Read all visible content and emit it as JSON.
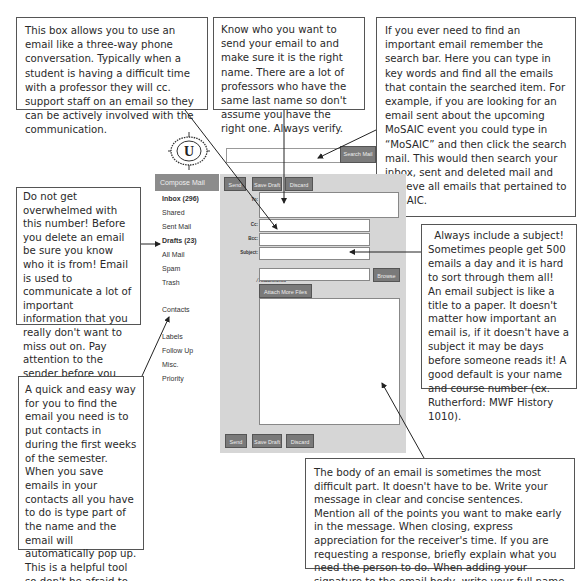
{
  "callouts": {
    "cc": "This box allows you to use an email like a three-way phone conversation. Typically when a student is having a difficult time with a professor they will cc. support staff on an email so they can be actively involved with the communication.",
    "to": "Know who you want to send your email to and make sure it is the right name. There are a lot of professors who have the same last name so don't assume you have the right one. Always verify.",
    "search": "If you ever need to find an important email remember the search bar. Here you can type in key words and find all the emails that contain the searched item. For example, if you are looking for an email sent about the upcoming MoSAIC event you could type in “MoSAIC” and then click the search mail. This would then search your inbox, sent and deleted mail and retrieve all emails that pertained to MoSAIC.",
    "inbox": "Do not get overwhelmed with this number! Before you delete an email be sure you know who it is from! Email is used to communicate a lot of important information that you really don't want to miss out on. Pay attention to the sender before you just get overwhelmed. IF it's not important to you then delete it.",
    "contacts": "A quick and easy way for you to find the email you need is to put contacts in during the first weeks of the semester. When you save emails in your contacts all you have to do is type part of the name and the email will automatically pop up. This is a helpful tool so don't be afraid to use it!",
    "subject_title": "Always include a subject!",
    "subject": "Sometimes people get 500 emails a day and it is hard to sort through them all! An email subject is like a title to a paper. It doesn't matter how important an email is, if it doesn't have a subject it may be days before someone reads it! A good default is your name and course number (ex. Rutherford: MWF History 1010).",
    "body": "The body of an email is sometimes the most difficult part. It doesn't have to be. Write your message in clear and concise sentences. Mention all of the points you want to make early in the message. When closing, express appreciation for the receiver's time. If you are requesting a response, briefly explain what you need the person to do. When adding your signature to the email body, write your full name and, if applicable, your university ID number."
  },
  "logo": {
    "letter": "U"
  },
  "search": {
    "placeholder": "",
    "button": "Search Mail"
  },
  "sidebar": {
    "compose": "Compose Mail",
    "items": [
      {
        "label": "Inbox (296)",
        "bold": true
      },
      {
        "label": "Shared"
      },
      {
        "label": "Sent Mail"
      },
      {
        "label": "Drafts (23)",
        "bold": true
      },
      {
        "label": "All Mail"
      },
      {
        "label": "Spam"
      },
      {
        "label": "Trash"
      },
      {
        "label": "Contacts"
      },
      {
        "label": "Labels"
      },
      {
        "label": "Follow Up"
      },
      {
        "label": "Misc."
      },
      {
        "label": "Priority"
      }
    ]
  },
  "compose": {
    "toolbar": {
      "send": "Send",
      "save_draft": "Save Draft",
      "discard": "Discard"
    },
    "fields": {
      "to_label": "To:",
      "cc_label": "Cc:",
      "bcc_label": "Bcc:",
      "subject_label": "Subject:"
    },
    "attachments_label": "Attachments",
    "browse": "Browse",
    "attach_more": "Attach More Files"
  },
  "colors": {
    "button_gray": "#7a7a7a",
    "panel_gray": "#d6d6d6",
    "compose_gray": "#8c8c8c"
  }
}
